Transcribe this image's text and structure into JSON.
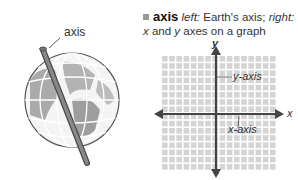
{
  "globe": {
    "label": "axis"
  },
  "definition": {
    "term": "axis",
    "left_label": "left:",
    "left_text": " Earth's axis; ",
    "right_label": "right:",
    "line2_x": "x",
    "line2_mid": " and ",
    "line2_y": "y",
    "line2_end": " axes on a graph"
  },
  "graph": {
    "y_label": "y",
    "x_label": "x",
    "y_axis_label": "y-axis",
    "x_axis_label": "x-axis"
  },
  "colors": {
    "grid": "#d4d4d4",
    "axis": "#444444",
    "bullet": "#999999"
  }
}
